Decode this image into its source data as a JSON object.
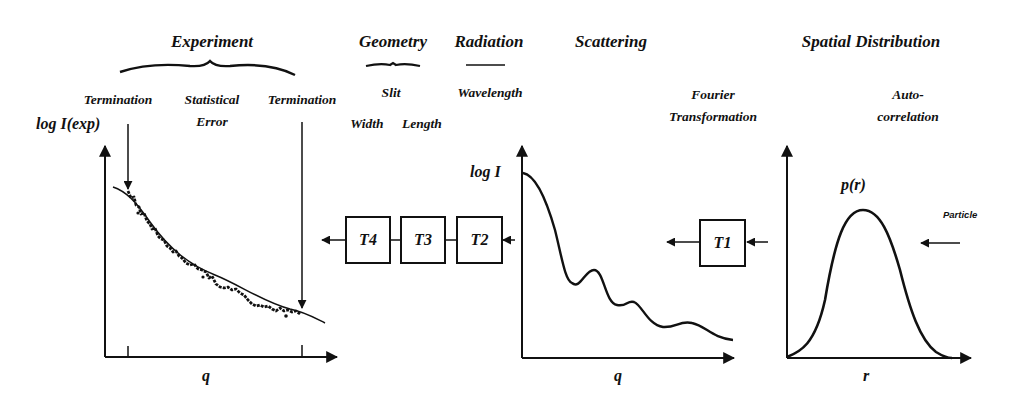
{
  "headings": {
    "experiment": "Experiment",
    "geometry": "Geometry",
    "radiation": "Radiation",
    "scattering": "Scattering",
    "spatial_distribution": "Spatial Distribution"
  },
  "sublabels": {
    "termination_left": "Termination",
    "statistical_error_1": "Statistical",
    "statistical_error_2": "Error",
    "termination_right": "Termination",
    "slit": "Slit",
    "width": "Width",
    "length": "Length",
    "wavelength": "Wavelength",
    "fourier_1": "Fourier",
    "fourier_2": "Transformation",
    "autocorrelation_1": "Auto-",
    "autocorrelation_2": "correlation",
    "particle": "Particle"
  },
  "plots": {
    "experimental": {
      "ylabel": "log I(exp)",
      "xlabel": "q"
    },
    "scattering": {
      "ylabel": "log I",
      "xlabel": "q"
    },
    "distance_distribution": {
      "ylabel": "p(r)",
      "xlabel": "r"
    }
  },
  "transforms": {
    "t1": "T1",
    "t2": "T2",
    "t3": "T3",
    "t4": "T4"
  }
}
